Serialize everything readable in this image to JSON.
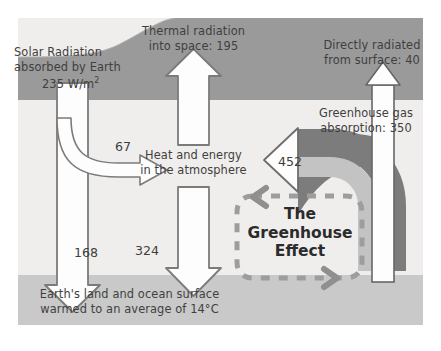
{
  "diagram": {
    "units": "W/m2",
    "bands": {
      "space_label": "space",
      "atmosphere_label": "atmosphere",
      "surface_label": "Earth's surface"
    },
    "center_box": {
      "line1": "The",
      "line2": "Greenhouse",
      "line3": "Effect"
    },
    "labels": {
      "solar_line1": "Solar Radiation",
      "solar_line2": "absorbed by Earth",
      "solar_line3_value": "235",
      "solar_line3_unit": " W/m",
      "solar_line3_exp": "2",
      "thermal_line1": "Thermal radiation",
      "thermal_line2": "into space: 195",
      "direct_line1": "Directly radiated",
      "direct_line2": "from surface: 40",
      "ghg_line1": "Greenhouse gas",
      "ghg_line2": "absorption: 350",
      "heat_line1": "Heat and energy",
      "heat_line2": "in the atmosphere",
      "surface_line1": "Earth's land and ocean surface",
      "surface_line2": "warmed to an average of 14°C"
    },
    "flows": [
      {
        "name": "solar-absorbed",
        "value": "235",
        "direction": "down",
        "note": "Solar Radiation absorbed by Earth"
      },
      {
        "name": "reflected-to-atmosphere",
        "value": "67",
        "direction": "curve-right",
        "note": "absorbed by atmosphere"
      },
      {
        "name": "solar-to-surface",
        "value": "168",
        "direction": "down",
        "note": "reaching the surface"
      },
      {
        "name": "thermal-to-space",
        "value": "195",
        "direction": "up",
        "note": "Thermal radiation into space"
      },
      {
        "name": "back-radiation",
        "value": "324",
        "direction": "down",
        "note": "back to surface"
      },
      {
        "name": "greenhouse-absorption",
        "value": "350",
        "direction": "curve-left",
        "note": "Greenhouse gas absorption"
      },
      {
        "name": "atmosphere-gain",
        "value": "452",
        "direction": "left",
        "note": "into heat and energy"
      },
      {
        "name": "direct-to-space",
        "value": "40",
        "direction": "up",
        "note": "Directly radiated from surface"
      }
    ],
    "colors": {
      "space_band": "#9a9a9a",
      "atmosphere_band": "#efeeec",
      "surface_band": "#c9c9c9",
      "arrow_fill": "#fdfdfd",
      "arrow_stroke": "#808080",
      "greenhouse_outer": "#7c7c7c",
      "greenhouse_inner": "#c3c3c3",
      "dashed_box": "#9d9d9d",
      "text": "#3f3f3f",
      "title_text": "#2b2b2b"
    }
  }
}
